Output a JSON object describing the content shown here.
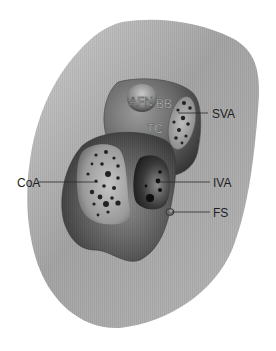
{
  "figure": {
    "type": "anatomical cross-section diagram",
    "background": "#ffffff",
    "colors": {
      "outer_tissue": "#a9a9a9",
      "outer_tissue_light": "#d2d2d2",
      "chamber_dark": "#2b2b2b",
      "chamber_mid": "#7a7a7a",
      "inner_light": "#b9b9b9",
      "dot": "#222222",
      "label_text": "#1e1e1e"
    }
  },
  "labels": {
    "afn": "AFN",
    "bb": "BB",
    "svaa": "SVA",
    "tc": "TC",
    "coa": "CoA",
    "iva": "IVA",
    "fs": "FS"
  }
}
